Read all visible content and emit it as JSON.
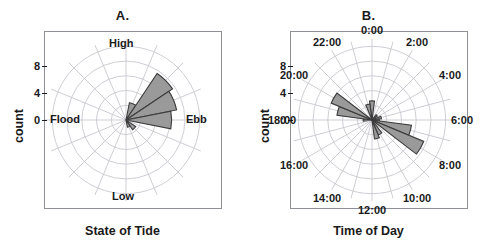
{
  "figure": {
    "width": 491,
    "height": 250,
    "background": "#ffffff",
    "sector_fill": "#9a9a9a",
    "sector_stroke": "#3b3b3b",
    "grid_color": "#c9c7cf",
    "frame_color": "#8f8f96"
  },
  "panels": [
    {
      "id": "A",
      "title": "A.",
      "axis_title": "State of Tide",
      "ylabel": "count",
      "yticks": [
        "0",
        "4",
        "8"
      ],
      "direction_labels": [
        {
          "text": "High",
          "angle_deg": 0
        },
        {
          "text": "Ebb",
          "angle_deg": 90
        },
        {
          "text": "Low",
          "angle_deg": 180
        },
        {
          "text": "Flood",
          "angle_deg": 270
        }
      ],
      "chart_data": {
        "type": "rose",
        "title": "A.",
        "xlabel": "State of Tide",
        "ylabel": "count",
        "rlim": [
          0,
          11
        ],
        "rticks": [
          0,
          4,
          8
        ],
        "grid": true,
        "legend": "none",
        "angle_unit": "degrees_clockwise_from_top",
        "sector_width_deg": 22.5,
        "categories": [
          "High",
          "High-Ebb 1",
          "High-Ebb 2",
          "Ebb-High",
          "Ebb",
          "Low-Ebb",
          "Low",
          "Flood"
        ],
        "bins": [
          {
            "center_deg": 0.0,
            "label": "High",
            "value": 0.0
          },
          {
            "center_deg": 22.5,
            "label": "High/Ebb",
            "value": 2.4
          },
          {
            "center_deg": 45.0,
            "label": "High-Ebb",
            "value": 7.6
          },
          {
            "center_deg": 67.5,
            "label": "Ebb-High",
            "value": 7.0
          },
          {
            "center_deg": 90.0,
            "label": "Ebb",
            "value": 6.2
          },
          {
            "center_deg": 112.5,
            "label": "Ebb/Low",
            "value": 0.0
          },
          {
            "center_deg": 135.0,
            "label": "Low-Ebb",
            "value": 1.6
          },
          {
            "center_deg": 157.5,
            "label": "Low",
            "value": 1.0
          },
          {
            "center_deg": 180.0,
            "label": "Low",
            "value": 0.0
          },
          {
            "center_deg": 202.5,
            "label": "Low/Flood",
            "value": 0.0
          },
          {
            "center_deg": 225.0,
            "label": "Flood-Low",
            "value": 0.0
          },
          {
            "center_deg": 247.5,
            "label": "Flood",
            "value": 0.0
          },
          {
            "center_deg": 270.0,
            "label": "Flood",
            "value": 0.0
          },
          {
            "center_deg": 292.5,
            "label": "Flood/High",
            "value": 0.0
          },
          {
            "center_deg": 315.0,
            "label": "High-Flood",
            "value": 0.0
          },
          {
            "center_deg": 337.5,
            "label": "High",
            "value": 0.0
          }
        ]
      }
    },
    {
      "id": "B",
      "title": "B.",
      "axis_title": "Time of Day",
      "ylabel": "count",
      "yticks": [
        "0",
        "4",
        "8"
      ],
      "direction_labels": [
        {
          "text": "0:00",
          "angle_deg": 0
        },
        {
          "text": "2:00",
          "angle_deg": 30
        },
        {
          "text": "4:00",
          "angle_deg": 60
        },
        {
          "text": "6:00",
          "angle_deg": 90
        },
        {
          "text": "8:00",
          "angle_deg": 120
        },
        {
          "text": "10:00",
          "angle_deg": 150
        },
        {
          "text": "12:00",
          "angle_deg": 180
        },
        {
          "text": "14:00",
          "angle_deg": 210
        },
        {
          "text": "16:00",
          "angle_deg": 240
        },
        {
          "text": "18:00",
          "angle_deg": 270
        },
        {
          "text": "20:00",
          "angle_deg": 300
        },
        {
          "text": "22:00",
          "angle_deg": 330
        }
      ],
      "chart_data": {
        "type": "rose",
        "title": "B.",
        "xlabel": "Time of Day",
        "ylabel": "count",
        "rlim": [
          0,
          11
        ],
        "rticks": [
          0,
          4,
          8
        ],
        "grid": true,
        "legend": "none",
        "angle_unit": "hours_clockwise_from_top",
        "sector_width_deg": 15,
        "categories": [
          "0:00",
          "1:00",
          "2:00",
          "3:00",
          "4:00",
          "5:00",
          "6:00",
          "7:00",
          "8:00",
          "9:00",
          "10:00",
          "11:00",
          "12:00",
          "13:00",
          "14:00",
          "15:00",
          "16:00",
          "17:00",
          "18:00",
          "19:00",
          "20:00",
          "21:00",
          "22:00",
          "23:00"
        ],
        "bins": [
          {
            "hour": 0,
            "center_deg": 0,
            "value": 2.6
          },
          {
            "hour": 1,
            "center_deg": 15,
            "value": 0.0
          },
          {
            "hour": 2,
            "center_deg": 30,
            "value": 0.0
          },
          {
            "hour": 3,
            "center_deg": 45,
            "value": 0.9
          },
          {
            "hour": 4,
            "center_deg": 60,
            "value": 0.0
          },
          {
            "hour": 5,
            "center_deg": 75,
            "value": 1.3
          },
          {
            "hour": 6,
            "center_deg": 90,
            "value": 1.0
          },
          {
            "hour": 7,
            "center_deg": 105,
            "value": 5.4
          },
          {
            "hour": 8,
            "center_deg": 120,
            "value": 7.6
          },
          {
            "hour": 9,
            "center_deg": 135,
            "value": 0.0
          },
          {
            "hour": 10,
            "center_deg": 150,
            "value": 2.2
          },
          {
            "hour": 11,
            "center_deg": 165,
            "value": 2.6
          },
          {
            "hour": 12,
            "center_deg": 180,
            "value": 0.0
          },
          {
            "hour": 13,
            "center_deg": 195,
            "value": 0.0
          },
          {
            "hour": 14,
            "center_deg": 210,
            "value": 0.0
          },
          {
            "hour": 15,
            "center_deg": 225,
            "value": 0.0
          },
          {
            "hour": 16,
            "center_deg": 240,
            "value": 0.0
          },
          {
            "hour": 17,
            "center_deg": 255,
            "value": 0.0
          },
          {
            "hour": 18,
            "center_deg": 270,
            "value": 1.2
          },
          {
            "hour": 19,
            "center_deg": 285,
            "value": 4.8
          },
          {
            "hour": 20,
            "center_deg": 300,
            "value": 6.0
          },
          {
            "hour": 21,
            "center_deg": 315,
            "value": 0.0
          },
          {
            "hour": 22,
            "center_deg": 330,
            "value": 0.0
          },
          {
            "hour": 23,
            "center_deg": 345,
            "value": 2.2
          }
        ]
      }
    }
  ]
}
